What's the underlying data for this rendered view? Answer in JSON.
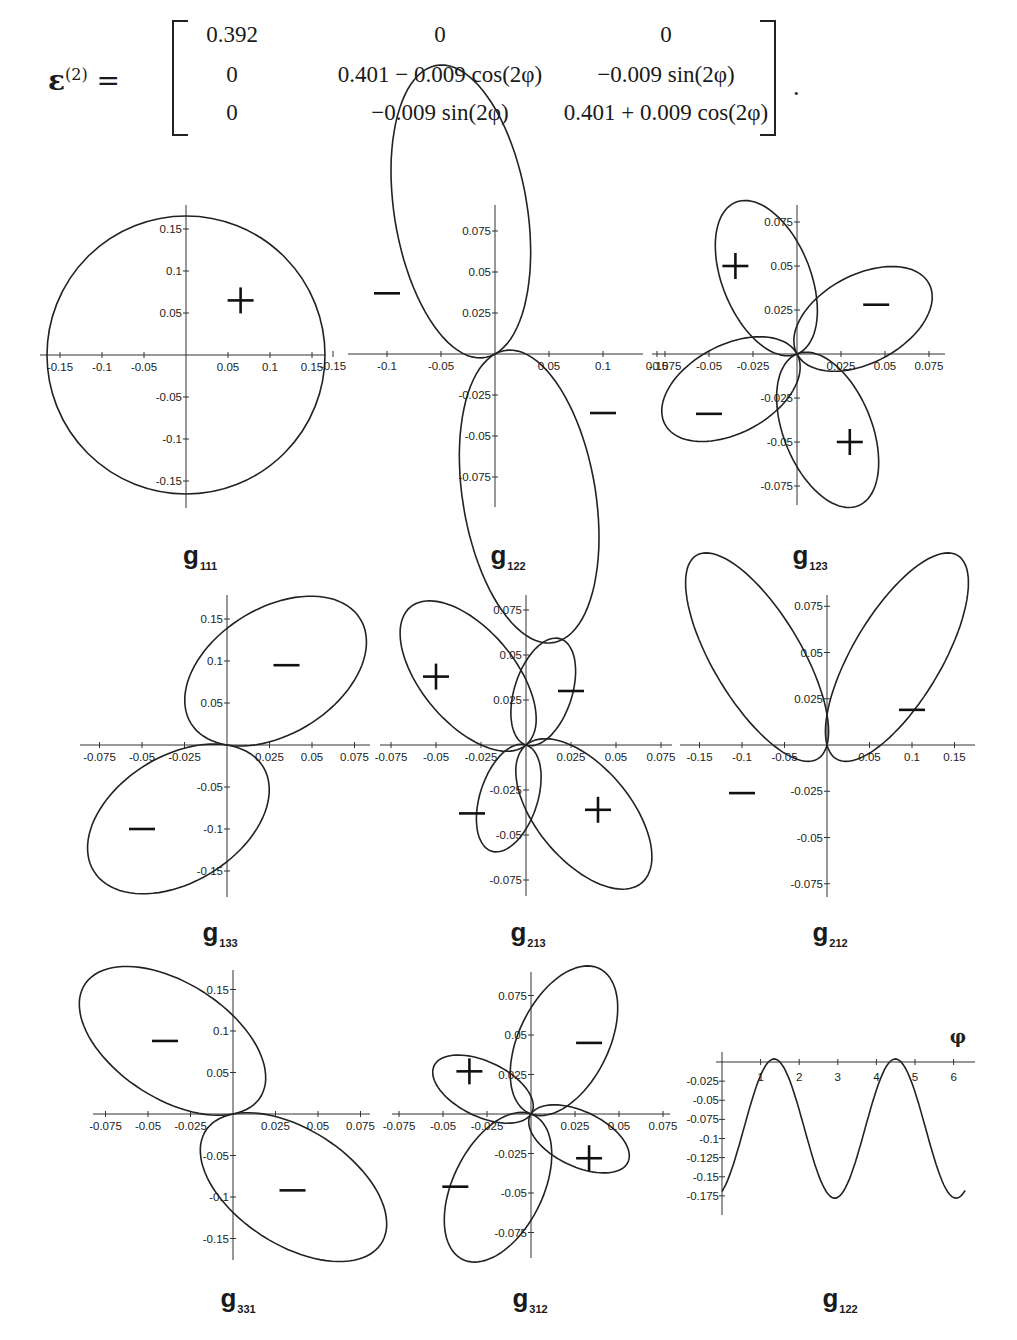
{
  "equation": {
    "lhs_symbol": "ε",
    "lhs_superscript": "(2)",
    "equals": "=",
    "matrix": [
      [
        "0.392",
        "0",
        "0"
      ],
      [
        "0",
        "0.401 − 0.009 cos(2φ)",
        "−0.009 sin(2φ)"
      ],
      [
        "0",
        "−0.009 sin(2φ)",
        "0.401 + 0.009 cos(2φ)"
      ]
    ],
    "terminator": "."
  },
  "captions": [
    {
      "base": "g",
      "sub": "111"
    },
    {
      "base": "g",
      "sub": "122"
    },
    {
      "base": "g",
      "sub": "123"
    },
    {
      "base": "g",
      "sub": "133"
    },
    {
      "base": "g",
      "sub": "213"
    },
    {
      "base": "g",
      "sub": "212"
    },
    {
      "base": "g",
      "sub": "331"
    },
    {
      "base": "g",
      "sub": "312"
    },
    {
      "base": "g",
      "sub": "122"
    }
  ],
  "chart_data": [
    {
      "type": "polar",
      "title": "g111",
      "xticks": [
        "-0.15",
        "-0.1",
        "-0.05",
        "0.05",
        "0.1",
        "0.15"
      ],
      "yticks": [
        "0.15",
        "0.1",
        "0.05",
        "-0.05",
        "-0.1",
        "-0.15"
      ],
      "xlim": [
        -0.17,
        0.17
      ],
      "ylim": [
        -0.17,
        0.17
      ],
      "shape": "circle",
      "radius": 0.165,
      "signs": [
        {
          "sign": "+",
          "x": 0.065,
          "y": 0.065
        }
      ]
    },
    {
      "type": "polar",
      "title": "g122",
      "xticks": [
        "-0.15",
        "-0.1",
        "-0.05",
        "0.05",
        "0.1",
        "0.15"
      ],
      "yticks": [
        "0.075",
        "0.05",
        "0.025",
        "-0.025",
        "-0.05",
        "-0.075"
      ],
      "xlim": [
        -0.17,
        0.17
      ],
      "ylim": [
        -0.09,
        0.09
      ],
      "shape": "two lobes (upper-left, lower-right), tilted",
      "signs": [
        {
          "sign": "−",
          "x": -0.1,
          "y": 0.037
        },
        {
          "sign": "−",
          "x": 0.1,
          "y": -0.036
        }
      ]
    },
    {
      "type": "polar",
      "title": "g123",
      "xticks": [
        "-0.075",
        "-0.05",
        "-0.025",
        "0.025",
        "0.05",
        "0.075"
      ],
      "yticks": [
        "0.075",
        "0.05",
        "0.025",
        "-0.025",
        "-0.05",
        "-0.075"
      ],
      "xlim": [
        -0.085,
        0.085
      ],
      "ylim": [
        -0.085,
        0.085
      ],
      "shape": "four-leaf",
      "signs": [
        {
          "sign": "+",
          "x": -0.035,
          "y": 0.05
        },
        {
          "sign": "−",
          "x": 0.045,
          "y": 0.028
        },
        {
          "sign": "−",
          "x": -0.05,
          "y": -0.034
        },
        {
          "sign": "+",
          "x": 0.03,
          "y": -0.05
        }
      ]
    },
    {
      "type": "polar",
      "title": "g133",
      "xticks": [
        "-0.075",
        "-0.05",
        "-0.025",
        "0.025",
        "0.05",
        "0.075"
      ],
      "yticks": [
        "0.15",
        "0.1",
        "0.05",
        "-0.05",
        "-0.1",
        "-0.15"
      ],
      "xlim": [
        -0.085,
        0.085
      ],
      "ylim": [
        -0.175,
        0.175
      ],
      "shape": "two lobes (upper-right, lower-left)",
      "signs": [
        {
          "sign": "−",
          "x": 0.035,
          "y": 0.095
        },
        {
          "sign": "−",
          "x": -0.05,
          "y": -0.1
        }
      ]
    },
    {
      "type": "polar",
      "title": "g213",
      "xticks": [
        "-0.075",
        "-0.05",
        "-0.025",
        "0.025",
        "0.05",
        "0.075"
      ],
      "yticks": [
        "0.075",
        "0.05",
        "0.025",
        "-0.025",
        "-0.05",
        "-0.075"
      ],
      "xlim": [
        -0.085,
        0.085
      ],
      "ylim": [
        -0.085,
        0.085
      ],
      "shape": "four-leaf (unequal)",
      "signs": [
        {
          "sign": "+",
          "x": -0.05,
          "y": 0.038
        },
        {
          "sign": "−",
          "x": 0.025,
          "y": 0.03
        },
        {
          "sign": "−",
          "x": -0.03,
          "y": -0.038
        },
        {
          "sign": "+",
          "x": 0.04,
          "y": -0.036
        }
      ]
    },
    {
      "type": "polar",
      "title": "g212",
      "xticks": [
        "-0.15",
        "-0.1",
        "-0.05",
        "0.05",
        "0.1",
        "0.15"
      ],
      "yticks": [
        "0.075",
        "0.05",
        "0.025",
        "-0.025",
        "-0.05",
        "-0.075"
      ],
      "xlim": [
        -0.17,
        0.17
      ],
      "ylim": [
        -0.08,
        0.08
      ],
      "shape": "two lobes (left lower, right upper)",
      "signs": [
        {
          "sign": "−",
          "x": -0.1,
          "y": -0.026
        },
        {
          "sign": "−",
          "x": 0.1,
          "y": 0.019
        }
      ]
    },
    {
      "type": "polar",
      "title": "g331",
      "xticks": [
        "-0.075",
        "-0.05",
        "-0.025",
        "0.025",
        "0.05",
        "0.075"
      ],
      "yticks": [
        "0.15",
        "0.1",
        "0.05",
        "-0.05",
        "-0.1",
        "-0.15"
      ],
      "xlim": [
        -0.085,
        0.085
      ],
      "ylim": [
        -0.175,
        0.175
      ],
      "shape": "two lobes (upper-left, lower-right)",
      "signs": [
        {
          "sign": "−",
          "x": -0.04,
          "y": 0.088
        },
        {
          "sign": "−",
          "x": 0.035,
          "y": -0.092
        }
      ]
    },
    {
      "type": "polar",
      "title": "g312",
      "xticks": [
        "-0.075",
        "-0.05",
        "-0.025",
        "0.025",
        "0.05",
        "0.075"
      ],
      "yticks": [
        "0.075",
        "0.05",
        "0.025",
        "-0.025",
        "-0.05",
        "-0.075"
      ],
      "xlim": [
        -0.085,
        0.085
      ],
      "ylim": [
        -0.09,
        0.09
      ],
      "shape": "four-leaf (unequal)",
      "signs": [
        {
          "sign": "+",
          "x": -0.035,
          "y": 0.027
        },
        {
          "sign": "−",
          "x": 0.033,
          "y": 0.045
        },
        {
          "sign": "−",
          "x": -0.043,
          "y": -0.046
        },
        {
          "sign": "+",
          "x": 0.033,
          "y": -0.028
        }
      ]
    },
    {
      "type": "line",
      "title": "g122",
      "xlabel": "φ",
      "xticks": [
        "1",
        "2",
        "3",
        "4",
        "5",
        "6"
      ],
      "yticks": [
        "-0.025",
        "-0.05",
        "-0.075",
        "-0.1",
        "-0.125",
        "-0.15",
        "-0.175"
      ],
      "xlim": [
        0,
        6.4
      ],
      "ylim": [
        -0.18,
        0.005
      ],
      "x": [
        0,
        0.5,
        1.0,
        1.35,
        1.6,
        2.0,
        2.5,
        2.95,
        3.5,
        4.0,
        4.5,
        4.75,
        5.0,
        5.5,
        6.1,
        6.3
      ],
      "y": [
        -0.165,
        -0.09,
        -0.02,
        0.004,
        -0.005,
        -0.06,
        -0.14,
        -0.178,
        -0.13,
        -0.05,
        0.004,
        -0.01,
        -0.06,
        -0.14,
        -0.178,
        -0.17
      ]
    }
  ]
}
